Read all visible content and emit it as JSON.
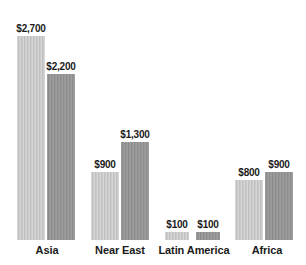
{
  "chart_data": {
    "type": "bar",
    "title": "",
    "subtitle": "",
    "xlabel": "",
    "ylabel": "",
    "grid": false,
    "legend_position": "none",
    "ylim": [
      0,
      2700
    ],
    "categories": [
      "Asia",
      "Near East",
      "Latin America",
      "Africa"
    ],
    "series": [
      {
        "name": "series-light",
        "color": "#c6c6c6",
        "values": [
          2700,
          900,
          100,
          800
        ],
        "labels": [
          "$2,700",
          "$900",
          "$100",
          "$800"
        ]
      },
      {
        "name": "series-dark",
        "color": "#949494",
        "values": [
          2200,
          1300,
          100,
          900
        ],
        "labels": [
          "$2,200",
          "$1,300",
          "$100",
          "$900"
        ]
      }
    ]
  },
  "geometry": {
    "baseline_y": 240,
    "max_bar_height": 204,
    "groups": [
      {
        "label_left": 12,
        "label_width": 70,
        "bars": [
          {
            "left": 17,
            "width": 28
          },
          {
            "left": 47,
            "width": 28
          }
        ]
      },
      {
        "label_left": 84,
        "label_width": 72,
        "bars": [
          {
            "left": 91,
            "width": 28
          },
          {
            "left": 121,
            "width": 28
          }
        ]
      },
      {
        "label_left": 153,
        "label_width": 82,
        "bars": [
          {
            "left": 165,
            "width": 24
          },
          {
            "left": 196,
            "width": 24
          }
        ]
      },
      {
        "label_left": 232,
        "label_width": 70,
        "bars": [
          {
            "left": 235,
            "width": 28
          },
          {
            "left": 265,
            "width": 28
          }
        ]
      }
    ]
  }
}
